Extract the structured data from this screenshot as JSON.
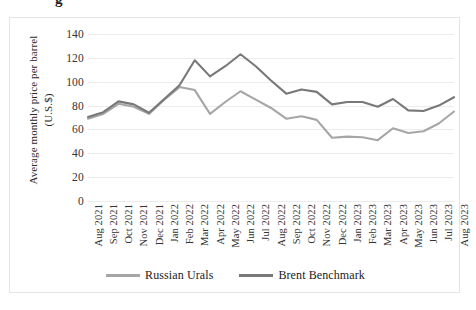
{
  "page": {
    "cropped_heading_fragment": "g"
  },
  "chart_data": {
    "type": "line",
    "title": "",
    "xlabel": "",
    "ylabel": "Average monthly price per barrel (U.S.$)",
    "ylabel_lines": [
      "Average monthly price per barrel",
      "(U.S.$)"
    ],
    "ylim": [
      0,
      140
    ],
    "ytick_step": 20,
    "ytick_labels": [
      "0",
      "20",
      "40",
      "60",
      "80",
      "100",
      "120",
      "140"
    ],
    "yticks": [
      0,
      20,
      40,
      60,
      80,
      100,
      120,
      140
    ],
    "grid": true,
    "grid_axis": "y",
    "legend_position": "bottom",
    "categories": [
      "Aug 2021",
      "Sep 2021",
      "Oct 2021",
      "Nov 2021",
      "Dec 2021",
      "Jan 2022",
      "Feb 2022",
      "Mar 2022",
      "Apr 2022",
      "May 2022",
      "Jun 2022",
      "Jul 2022",
      "Aug 2022",
      "Sep 2022",
      "Oct 2022",
      "Nov 2022",
      "Dec 2022",
      "Jan 2023",
      "Feb 2023",
      "Mar 2023",
      "Apr 2023",
      "May 2023",
      "Jun 2023",
      "Jul 2023",
      "Aug 2023"
    ],
    "series": [
      {
        "name": "Russian Urals",
        "color": "#a6a6a6",
        "values": [
          69,
          73,
          81.5,
          79,
          73,
          85,
          95.5,
          93,
          73,
          83,
          92,
          85,
          78,
          69,
          71,
          68,
          53,
          54,
          53.5,
          51,
          61,
          57,
          58.5,
          65,
          75
        ]
      },
      {
        "name": "Brent Benchmark",
        "color": "#787878",
        "values": [
          70.5,
          74.5,
          83.5,
          81,
          74,
          85.5,
          97,
          118,
          104.5,
          113,
          123,
          113,
          101,
          90,
          93.5,
          91.5,
          81,
          83,
          83,
          79,
          85.5,
          76,
          75.5,
          80,
          87
        ]
      }
    ],
    "legend": [
      {
        "label": "Russian Urals",
        "color": "#a6a6a6"
      },
      {
        "label": "Brent Benchmark",
        "color": "#787878"
      }
    ]
  }
}
